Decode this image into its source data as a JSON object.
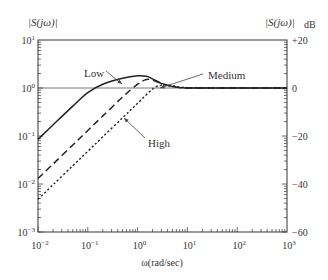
{
  "chart_data": {
    "type": "line",
    "title": "",
    "xlabel": "ω(rad/sec)",
    "ylabel_left": "|S(jω)|",
    "ylabel_right": "|S(jω)|dB",
    "xscale": "log",
    "yscale": "log",
    "xlim": [
      0.01,
      1000
    ],
    "ylim": [
      0.001,
      10
    ],
    "ylim_right_db": [
      -60,
      20
    ],
    "x_ticks": [
      "10^-2",
      "10^-1",
      "10^0",
      "10^1",
      "10^2",
      "10^3"
    ],
    "y_ticks_left": [
      "10^-3",
      "10^-2",
      "10^-1",
      "10^0",
      "10^1"
    ],
    "y_ticks_right": [
      "-60",
      "-40",
      "-20",
      "0",
      "+20"
    ],
    "grid": false,
    "reference_line": {
      "y": 1.0,
      "label": "0 dB"
    },
    "series": [
      {
        "name": "Low",
        "style": "solid",
        "x": [
          0.01,
          0.02,
          0.05,
          0.1,
          0.2,
          0.5,
          1.0,
          1.5,
          2.0,
          3.0,
          5.0,
          10,
          100,
          1000
        ],
        "y": [
          0.085,
          0.17,
          0.42,
          0.8,
          1.2,
          1.6,
          1.8,
          1.75,
          1.55,
          1.25,
          1.08,
          1.0,
          1.0,
          1.0
        ]
      },
      {
        "name": "Medium",
        "style": "dashed",
        "x": [
          0.01,
          0.02,
          0.05,
          0.1,
          0.2,
          0.5,
          1.0,
          1.5,
          2.0,
          3.0,
          5.0,
          10,
          100,
          1000
        ],
        "y": [
          0.013,
          0.026,
          0.065,
          0.13,
          0.26,
          0.65,
          1.2,
          1.5,
          1.45,
          1.25,
          1.08,
          1.0,
          1.0,
          1.0
        ]
      },
      {
        "name": "High",
        "style": "dotted",
        "x": [
          0.01,
          0.02,
          0.05,
          0.1,
          0.2,
          0.5,
          1.0,
          2.0,
          3.0,
          5.0,
          10,
          100,
          1000
        ],
        "y": [
          0.0048,
          0.0096,
          0.024,
          0.048,
          0.096,
          0.24,
          0.48,
          0.95,
          1.15,
          1.12,
          1.02,
          1.0,
          1.0
        ]
      }
    ],
    "annotations": [
      {
        "text": "Low",
        "points_to": "Low curve near ω≈0.5"
      },
      {
        "text": "Medium",
        "points_to": "Medium curve near ω≈1.5"
      },
      {
        "text": "High",
        "points_to": "High curve near ω≈0.3"
      }
    ]
  },
  "labels": {
    "left_axis_title": "|S(jω)|",
    "right_axis_title": "|S(jω)|",
    "right_axis_unit": "dB",
    "x_axis_title": "ω(rad/sec)",
    "annotation_low": "Low",
    "annotation_medium": "Medium",
    "annotation_high": "High"
  }
}
